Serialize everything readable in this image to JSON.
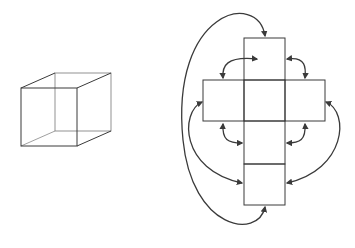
{
  "figure": {
    "colors": {
      "background": "#ffffff",
      "stroke": "#3a3a3a",
      "arrow": "#3a3a3a"
    },
    "cube": {
      "front_face": {
        "x": 21,
        "y": 88,
        "w": 56,
        "h": 58
      },
      "depth_offset": {
        "dx": 34,
        "dy": -15
      }
    },
    "net": {
      "cells": [
        {
          "id": "top",
          "x": 244,
          "y": 38,
          "w": 41,
          "h": 42
        },
        {
          "id": "left",
          "x": 203,
          "y": 80,
          "w": 41,
          "h": 41
        },
        {
          "id": "center",
          "x": 244,
          "y": 80,
          "w": 41,
          "h": 41
        },
        {
          "id": "right",
          "x": 285,
          "y": 80,
          "w": 40,
          "h": 41
        },
        {
          "id": "lower",
          "x": 244,
          "y": 121,
          "w": 41,
          "h": 43
        },
        {
          "id": "bottom",
          "x": 244,
          "y": 164,
          "w": 41,
          "h": 41
        }
      ],
      "arrows": [
        {
          "id": "top-left-corner",
          "d": "M 257 59 C 226 56, 222 66, 223 78"
        },
        {
          "id": "top-right-corner",
          "d": "M 287 59 C 306 56, 306 68, 305 78"
        },
        {
          "id": "left-low-corner",
          "d": "M 223 124 C 222 140, 228 143, 242 143"
        },
        {
          "id": "right-low-corner",
          "d": "M 305 124 C 306 140, 300 143, 287 143"
        },
        {
          "id": "left-side-to-bottom",
          "d": "M 202 102 C 180 112, 180 170, 242 183"
        },
        {
          "id": "right-side-to-bottom",
          "d": "M 326 102 C 350 112, 346 170, 287 183"
        },
        {
          "id": "top-to-bottom-outer",
          "d": "M 265 36 C 258 -10, 170 10, 183 140 C 192 230, 258 240, 265 207"
        }
      ]
    }
  }
}
